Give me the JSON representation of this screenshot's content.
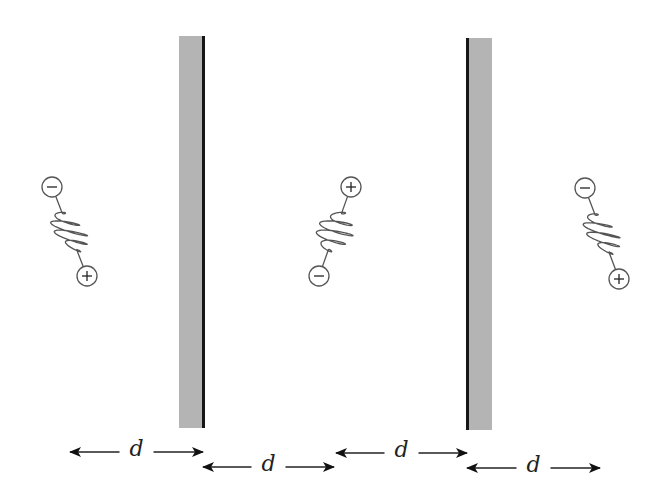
{
  "diagram": {
    "colors": {
      "plate_fill": "#b4b4b4",
      "plate_edge": "#161616",
      "line": "#555555",
      "text": "#222222",
      "background": "#ffffff"
    },
    "plates": [
      {
        "name": "left-plate",
        "x": 179,
        "y": 36,
        "width": 26,
        "height": 392,
        "edge_side": "right"
      },
      {
        "name": "right-plate",
        "x": 466,
        "y": 38,
        "width": 26,
        "height": 392,
        "edge_side": "left"
      }
    ],
    "dipoles": [
      {
        "name": "left-dipole",
        "top_charge": "−",
        "bottom_charge": "+",
        "top": {
          "x": 52,
          "y": 187
        },
        "bottom": {
          "x": 87,
          "y": 276
        }
      },
      {
        "name": "middle-dipole",
        "top_charge": "+",
        "bottom_charge": "−",
        "top": {
          "x": 351,
          "y": 187
        },
        "bottom": {
          "x": 319,
          "y": 276
        }
      },
      {
        "name": "right-dipole",
        "top_charge": "−",
        "bottom_charge": "+",
        "top": {
          "x": 585,
          "y": 188
        },
        "bottom": {
          "x": 619,
          "y": 279
        }
      }
    ],
    "dimensions": [
      {
        "name": "dimension-1",
        "label": "d",
        "x1": 70,
        "x2": 203,
        "y": 452
      },
      {
        "name": "dimension-2",
        "label": "d",
        "x1": 203,
        "x2": 334,
        "y": 467
      },
      {
        "name": "dimension-3",
        "label": "d",
        "x1": 336,
        "x2": 467,
        "y": 453
      },
      {
        "name": "dimension-4",
        "label": "d",
        "x1": 467,
        "x2": 600,
        "y": 468
      }
    ]
  }
}
